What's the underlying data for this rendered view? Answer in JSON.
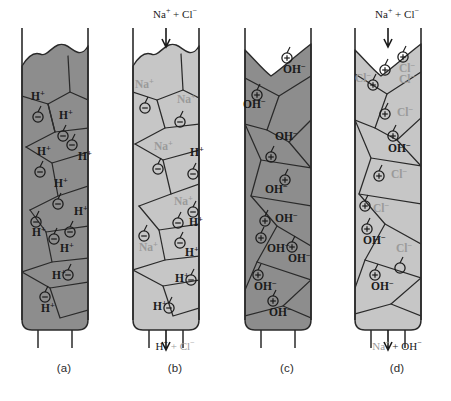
{
  "figure": {
    "panel_width": 112,
    "colors": {
      "resin_dark": "#8d8d8d",
      "resin_light": "#c6c6c6",
      "outline": "#2a2a2a",
      "ink_dark": "#1a1a1a",
      "ink_gray": "#9a9a9a",
      "background": "#ffffff"
    }
  },
  "panels": [
    {
      "id": "a",
      "caption": "(a)",
      "left": 8,
      "fill": "#8d8d8d",
      "top_profile": "bumpy",
      "feed": null,
      "outlet": null,
      "ions": [
        {
          "label": "H",
          "charge": "+",
          "tone": "dark",
          "x": 23,
          "y": 100,
          "cx": 30,
          "cy": 117,
          "sign": "-"
        },
        {
          "label": "H",
          "charge": "+",
          "tone": "dark",
          "x": 51,
          "y": 119,
          "cx": 55,
          "cy": 136,
          "sign": "-"
        },
        {
          "label": "H",
          "charge": "+",
          "tone": "dark",
          "x": 29,
          "y": 155,
          "cx": 32,
          "cy": 172,
          "sign": "-"
        },
        {
          "label": "H",
          "charge": "+",
          "tone": "dark",
          "x": 70,
          "y": 160,
          "cx": 64,
          "cy": 145,
          "sign": "-"
        },
        {
          "label": "H",
          "charge": "+",
          "tone": "dark",
          "x": 46,
          "y": 187,
          "cx": 50,
          "cy": 204,
          "sign": "-"
        },
        {
          "label": "H",
          "charge": "+",
          "tone": "dark",
          "x": 66,
          "y": 215,
          "cx": 62,
          "cy": 232,
          "sign": "-"
        },
        {
          "label": "H",
          "charge": "+",
          "tone": "dark",
          "x": 24,
          "y": 236,
          "cx": 28,
          "cy": 222,
          "sign": "-"
        },
        {
          "label": "H",
          "charge": "+",
          "tone": "dark",
          "x": 52,
          "y": 252,
          "cx": 46,
          "cy": 239,
          "sign": "-"
        },
        {
          "label": "H",
          "charge": "+",
          "tone": "dark",
          "x": 44,
          "y": 279,
          "cx": 60,
          "cy": 275,
          "sign": "-"
        },
        {
          "label": "H",
          "charge": "+",
          "tone": "dark",
          "x": 33,
          "y": 312,
          "cx": 37,
          "cy": 297,
          "sign": "-"
        }
      ]
    },
    {
      "id": "b",
      "caption": "(b)",
      "left": 119,
      "fill": "#c6c6c6",
      "top_profile": "bumpy",
      "feed": {
        "parts": [
          {
            "text": "Na",
            "charge": "+",
            "tone": "dark"
          },
          {
            "text": " + Cl",
            "charge": "−",
            "tone": "dark"
          }
        ]
      },
      "outlet": {
        "parts": [
          {
            "text": "H",
            "charge": "+",
            "tone": "dark"
          },
          {
            "text": " + Cl",
            "charge": "−",
            "tone": "gray"
          }
        ]
      },
      "ions": [
        {
          "label": "Na",
          "charge": "+",
          "tone": "gray",
          "x": 16,
          "y": 88,
          "cx": 26,
          "cy": 108,
          "sign": "-"
        },
        {
          "label": "Na",
          "charge": "+",
          "tone": "gray",
          "x": 58,
          "y": 103,
          "cx": 61,
          "cy": 122,
          "sign": "-"
        },
        {
          "label": "Na",
          "charge": "+",
          "tone": "gray",
          "x": 35,
          "y": 150,
          "cx": 39,
          "cy": 169,
          "sign": "-"
        },
        {
          "label": "H",
          "charge": "+",
          "tone": "dark",
          "x": 71,
          "y": 156,
          "cx": 74,
          "cy": 174,
          "sign": "-"
        },
        {
          "label": "Na",
          "charge": "+",
          "tone": "gray",
          "x": 55,
          "y": 205,
          "cx": 59,
          "cy": 223,
          "sign": "-"
        },
        {
          "label": "H",
          "charge": "+",
          "tone": "dark",
          "x": 70,
          "y": 226,
          "cx": 74,
          "cy": 212,
          "sign": "-"
        },
        {
          "label": "Na",
          "charge": "+",
          "tone": "gray",
          "x": 20,
          "y": 251,
          "cx": 25,
          "cy": 236,
          "sign": "-"
        },
        {
          "label": "H",
          "charge": "+",
          "tone": "dark",
          "x": 66,
          "y": 256,
          "cx": 61,
          "cy": 243,
          "sign": "-"
        },
        {
          "label": "H",
          "charge": "+",
          "tone": "dark",
          "x": 56,
          "y": 282,
          "cx": 72,
          "cy": 280,
          "sign": "-"
        },
        {
          "label": "H",
          "charge": "+",
          "tone": "dark",
          "x": 34,
          "y": 310,
          "cx": 50,
          "cy": 308,
          "sign": "-"
        }
      ]
    },
    {
      "id": "c",
      "caption": "(c)",
      "left": 231,
      "fill": "#8d8d8d",
      "top_profile": "notch",
      "feed": null,
      "outlet": null,
      "ions": [
        {
          "label": "OH",
          "charge": "−",
          "tone": "dark",
          "x": 52,
          "y": 73,
          "cx": 56,
          "cy": 58,
          "sign": "+"
        },
        {
          "label": "OH",
          "charge": "−",
          "tone": "dark",
          "x": 12,
          "y": 108,
          "cx": 26,
          "cy": 95,
          "sign": "+"
        },
        {
          "label": "OH",
          "charge": "−",
          "tone": "dark",
          "x": 44,
          "y": 140,
          "cx": 40,
          "cy": 157,
          "sign": "+"
        },
        {
          "label": "OH",
          "charge": "−",
          "tone": "dark",
          "x": 34,
          "y": 193,
          "cx": 54,
          "cy": 180,
          "sign": "+"
        },
        {
          "label": "OH",
          "charge": "−",
          "tone": "dark",
          "x": 44,
          "y": 222,
          "cx": 34,
          "cy": 221,
          "sign": "+"
        },
        {
          "label": "OH",
          "charge": "−",
          "tone": "dark",
          "x": 36,
          "y": 252,
          "cx": 30,
          "cy": 238,
          "sign": "+"
        },
        {
          "label": "OH",
          "charge": "−",
          "tone": "dark",
          "x": 57,
          "y": 262,
          "cx": 61,
          "cy": 247,
          "sign": "+"
        },
        {
          "label": "OH",
          "charge": "−",
          "tone": "dark",
          "x": 23,
          "y": 290,
          "cx": 27,
          "cy": 275,
          "sign": "+"
        },
        {
          "label": "OH",
          "charge": "−",
          "tone": "dark",
          "x": 38,
          "y": 316,
          "cx": 42,
          "cy": 301,
          "sign": "+"
        }
      ]
    },
    {
      "id": "d",
      "caption": "(d)",
      "left": 341,
      "fill": "#c6c6c6",
      "top_profile": "notch",
      "feed": {
        "parts": [
          {
            "text": "Na",
            "charge": "+",
            "tone": "dark"
          },
          {
            "text": " + Cl",
            "charge": "−",
            "tone": "dark"
          }
        ]
      },
      "outlet": {
        "parts": [
          {
            "text": "Na",
            "charge": "+",
            "tone": "gray"
          },
          {
            "text": " + OH",
            "charge": "−",
            "tone": "dark"
          }
        ]
      },
      "ions": [
        {
          "label": "Cl",
          "charge": "−",
          "tone": "gray",
          "x": 58,
          "y": 72,
          "cx": 62,
          "cy": 57,
          "sign": "+"
        },
        {
          "label": "Cl",
          "charge": "−",
          "tone": "gray",
          "x": 14,
          "y": 82,
          "cx": 32,
          "cy": 85,
          "sign": "+"
        },
        {
          "label": "Cl",
          "charge": "−",
          "tone": "gray",
          "x": 58,
          "y": 83,
          "cx": 44,
          "cy": 70,
          "sign": "+"
        },
        {
          "label": "Cl",
          "charge": "−",
          "tone": "gray",
          "x": 56,
          "y": 116,
          "cx": 44,
          "cy": 114,
          "sign": "+"
        },
        {
          "label": "OH",
          "charge": "−",
          "tone": "dark",
          "x": 47,
          "y": 152,
          "cx": 52,
          "cy": 136,
          "sign": "+"
        },
        {
          "label": "Cl",
          "charge": "−",
          "tone": "gray",
          "x": 50,
          "y": 178,
          "cx": 38,
          "cy": 176,
          "sign": "+"
        },
        {
          "label": "Cl",
          "charge": "−",
          "tone": "gray",
          "x": 32,
          "y": 212,
          "cx": 24,
          "cy": 206,
          "sign": "+"
        },
        {
          "label": "OH",
          "charge": "−",
          "tone": "dark",
          "x": 22,
          "y": 244,
          "cx": 26,
          "cy": 229,
          "sign": "+"
        },
        {
          "label": "Cl",
          "charge": "−",
          "tone": "gray",
          "x": 55,
          "y": 252,
          "cx": 59,
          "cy": 268,
          "sign": "none"
        },
        {
          "label": "OH",
          "charge": "−",
          "tone": "dark",
          "x": 30,
          "y": 290,
          "cx": 34,
          "cy": 275,
          "sign": "+"
        }
      ]
    }
  ]
}
